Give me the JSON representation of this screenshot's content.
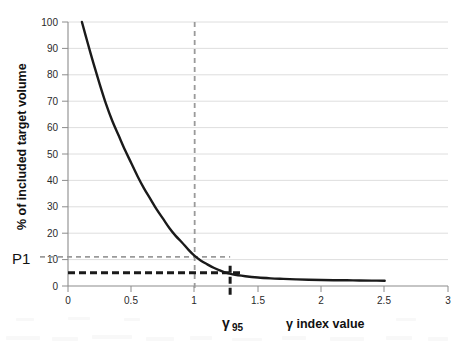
{
  "chart_data": {
    "type": "line",
    "title": "",
    "subtitle": "",
    "xlabel": "γ  index value",
    "ylabel": "% of included target volume",
    "xlim": [
      0,
      3
    ],
    "ylim": [
      0,
      100
    ],
    "grid": "horizontal",
    "legend": "none",
    "x_ticks": [
      "0",
      "0.5",
      "1",
      "1.5",
      "2",
      "2.5",
      "3"
    ],
    "x_tick_values": [
      0,
      0.5,
      1,
      1.5,
      2,
      2.5,
      3
    ],
    "y_ticks": [
      "0",
      "10",
      "20",
      "30",
      "40",
      "50",
      "60",
      "70",
      "80",
      "90",
      "100"
    ],
    "y_tick_values": [
      0,
      10,
      20,
      30,
      40,
      50,
      60,
      70,
      80,
      90,
      100
    ],
    "series": [
      {
        "name": "gamma index volume histogram",
        "color": "#1a1a1a",
        "x": [
          0.11,
          0.15,
          0.2,
          0.25,
          0.3,
          0.35,
          0.4,
          0.45,
          0.5,
          0.55,
          0.6,
          0.65,
          0.7,
          0.75,
          0.8,
          0.85,
          0.9,
          0.95,
          1.0,
          1.05,
          1.1,
          1.15,
          1.2,
          1.25,
          1.3,
          1.4,
          1.5,
          1.6,
          1.7,
          1.8,
          1.9,
          2.0,
          2.1,
          2.2,
          2.3,
          2.4,
          2.5
        ],
        "y": [
          100,
          93,
          84.5,
          76.5,
          69,
          62.5,
          57,
          51.5,
          46.5,
          41.5,
          37,
          33,
          29,
          25.5,
          22,
          19,
          16.5,
          13.8,
          11.4,
          9.6,
          8.2,
          6.9,
          5.9,
          5.0,
          4.4,
          3.7,
          3.2,
          2.9,
          2.7,
          2.5,
          2.35,
          2.25,
          2.2,
          2.15,
          2.1,
          2.05,
          2.0
        ]
      }
    ],
    "annotations": [
      {
        "name": "p1-label",
        "text": "P1",
        "value": 11,
        "axis": "y",
        "style": "dashed-gray",
        "color": "#9a9a9a",
        "x_from": 0,
        "x_to": 1.28
      },
      {
        "name": "gamma95-reference-line",
        "text": "γ",
        "subscript": "95",
        "value": 1.28,
        "axis": "x",
        "style": "dashed-black",
        "color": "#1a1a1a"
      },
      {
        "name": "gamma-unity-line",
        "text": "",
        "value": 1.0,
        "axis": "x",
        "style": "dashed-gray",
        "color": "#9a9a9a"
      },
      {
        "name": "gamma95-volume-line",
        "text": "",
        "value": 5,
        "axis": "y",
        "style": "dashed-black",
        "color": "#1a1a1a",
        "x_from": 0,
        "x_to": 1.38
      }
    ],
    "colors": {
      "curve": "#1a1a1a",
      "gridline": "#d9d9d9",
      "axis": "#8c8c8c",
      "dashed_gray": "#9a9a9a",
      "dashed_black": "#1a1a1a",
      "background": "#ffffff"
    }
  }
}
